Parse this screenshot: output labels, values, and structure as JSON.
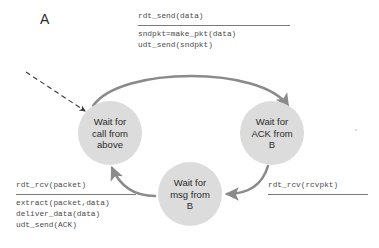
{
  "figure": {
    "corner_label": "A",
    "background_color": "#ffffff",
    "state_fill_color": "#dcdcdc",
    "arrow_color": "#8a8a8a",
    "text_color": "#2b2b2b",
    "code_text_color": "#4a4a4a"
  },
  "states": [
    {
      "id": "wait-for-call-from-above",
      "line1": "Wait for",
      "line2": "call from",
      "line3": "above",
      "cx": 110,
      "cy": 133,
      "r": 32
    },
    {
      "id": "wait-for-ack-from-b",
      "line1": "Wait for",
      "line2": "ACK from",
      "line3": "B",
      "cx": 272,
      "cy": 133,
      "r": 32
    },
    {
      "id": "wait-for-msg-from-b",
      "line1": "Wait for",
      "line2": "msg from",
      "line3": "B",
      "cx": 190,
      "cy": 194,
      "r": 32
    }
  ],
  "transitions": [
    {
      "id": "rdt-send-transition",
      "from": "wait-for-call-from-above",
      "to": "wait-for-ack-from-b",
      "event": "rdt_send(data)",
      "actions": [
        "sndpkt=make_pkt(data)",
        "udt_send(sndpkt)"
      ]
    },
    {
      "id": "rdt-rcv-rcvpkt-transition",
      "from": "wait-for-ack-from-b",
      "to": "wait-for-msg-from-b",
      "event": "rdt_rcv(rcvpkt)",
      "actions": []
    },
    {
      "id": "rdt-rcv-packet-transition",
      "from": "wait-for-msg-from-b",
      "to": "wait-for-call-from-above",
      "event": "rdt_rcv(packet)",
      "actions": [
        "extract(packet,data)",
        "deliver_data(data)",
        "udt_send(ACK)"
      ]
    }
  ],
  "entry_arrow": {
    "id": "initial-state-arrow",
    "style": "dashed",
    "target": "wait-for-call-from-above"
  }
}
